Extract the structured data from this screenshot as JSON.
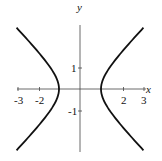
{
  "chart_data": {
    "type": "line",
    "title": "",
    "equation": "x^2 - y^2 = 1",
    "xlabel": "x",
    "ylabel": "y",
    "xlim": [
      -3,
      3
    ],
    "ylim": [
      -3,
      3
    ],
    "grid": false,
    "x_ticks": [
      -3,
      -2,
      2,
      3
    ],
    "x_tick_labels": [
      "-3",
      "-2",
      "2",
      "3"
    ],
    "y_ticks": [
      1,
      -1
    ],
    "y_tick_labels": [
      "1",
      "-1"
    ],
    "series": [
      {
        "name": "right branch",
        "x": [
          3,
          2.5,
          2,
          1.5,
          1.2,
          1,
          1.2,
          1.5,
          2,
          2.5,
          3
        ],
        "y": [
          2.83,
          2.29,
          1.73,
          1.12,
          0.66,
          0,
          -0.66,
          -1.12,
          -1.73,
          -2.29,
          -2.83
        ]
      },
      {
        "name": "left branch",
        "x": [
          -3,
          -2.5,
          -2,
          -1.5,
          -1.2,
          -1,
          -1.2,
          -1.5,
          -2,
          -2.5,
          -3
        ],
        "y": [
          2.83,
          2.29,
          1.73,
          1.12,
          0.66,
          0,
          -0.66,
          -1.12,
          -1.73,
          -2.29,
          -2.83
        ]
      }
    ]
  }
}
